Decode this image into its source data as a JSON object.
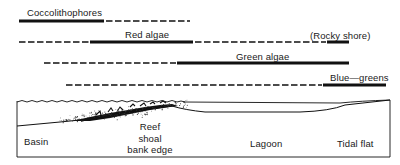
{
  "ranges": {
    "title": "Algal group distribution across carbonate platform environments",
    "rows": [
      {
        "label": "Coccolithophores",
        "y": 21,
        "segments": [
          {
            "type": "solid",
            "x1": 19,
            "x2": 104
          },
          {
            "type": "dashed",
            "x1": 106,
            "x2": 190
          }
        ]
      },
      {
        "label": "Red algae",
        "note": "(Rocky shore)",
        "y": 42,
        "segments": [
          {
            "type": "dashed",
            "x1": 19,
            "x2": 89
          },
          {
            "type": "solid",
            "x1": 90,
            "x2": 193
          },
          {
            "type": "dashed",
            "x1": 195,
            "x2": 326
          },
          {
            "type": "solid",
            "x1": 327,
            "x2": 349
          }
        ]
      },
      {
        "label": "Green algae",
        "y": 63,
        "segments": [
          {
            "type": "dashed",
            "x1": 44,
            "x2": 176
          },
          {
            "type": "solid",
            "x1": 177,
            "x2": 349
          }
        ]
      },
      {
        "label": "Blue—greens",
        "y": 85,
        "segments": [
          {
            "type": "dashed",
            "x1": 66,
            "x2": 322
          },
          {
            "type": "solid",
            "x1": 323,
            "x2": 386
          }
        ]
      }
    ]
  },
  "cross_section": {
    "zones": [
      {
        "key": "basin",
        "text": "Basin"
      },
      {
        "key": "reef_1",
        "text": "Reef"
      },
      {
        "key": "reef_2",
        "text": "shoal"
      },
      {
        "key": "reef_3",
        "text": "bank edge"
      },
      {
        "key": "lagoon",
        "text": "Lagoon"
      },
      {
        "key": "tidal",
        "text": "Tidal flat"
      }
    ]
  },
  "colors": {
    "ink": "#111111",
    "background": "#ffffff"
  }
}
